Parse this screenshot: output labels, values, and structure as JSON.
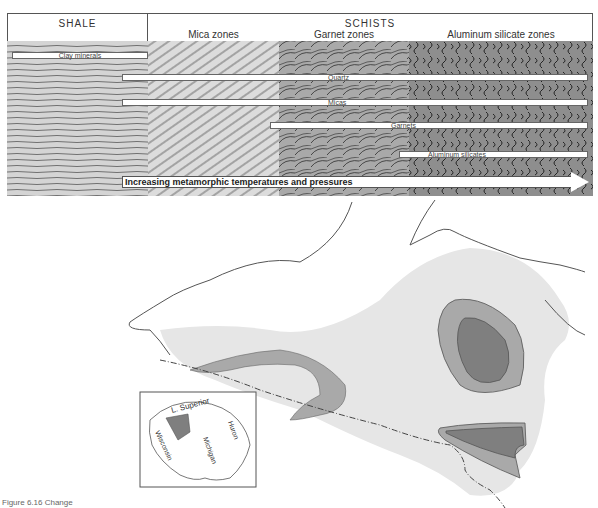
{
  "diagram": {
    "headers": {
      "shale": "SHALE",
      "schists": "SCHISTS"
    },
    "zones": [
      {
        "label": "",
        "name": "shale",
        "fill": "#cfcfcf"
      },
      {
        "label": "Mica zones",
        "name": "mica",
        "fill": "#d8d8d8"
      },
      {
        "label": "Garnet zones",
        "name": "garnet",
        "fill": "#a8a8a8"
      },
      {
        "label": "Aluminum silicate zones",
        "name": "aluminum-silicate",
        "fill": "#8c8c8c"
      }
    ],
    "mineral_bars": [
      {
        "label": "Clay minerals",
        "start_zone": "shale",
        "end_zone": "shale"
      },
      {
        "label": "Quartz",
        "start_zone": "shale",
        "end_zone": "aluminum-silicate"
      },
      {
        "label": "Micas",
        "start_zone": "shale",
        "end_zone": "aluminum-silicate"
      },
      {
        "label": "Garnets",
        "start_zone": "garnet",
        "end_zone": "aluminum-silicate"
      },
      {
        "label": "Aluminum silicates",
        "start_zone": "aluminum-silicate",
        "end_zone": "aluminum-silicate"
      }
    ],
    "arrow_label": "Increasing metamorphic temperatures and pressures"
  },
  "map": {
    "inset_labels": [
      "L. Superior",
      "Wisconsin",
      "Michigan",
      "Huron"
    ],
    "colors": {
      "light_region": "#e6e6e6",
      "medium_region": "#a9a9a9",
      "dark_region": "#7f7f7f",
      "outline": "#555555"
    }
  },
  "caption": "Figure 6.16  Change"
}
